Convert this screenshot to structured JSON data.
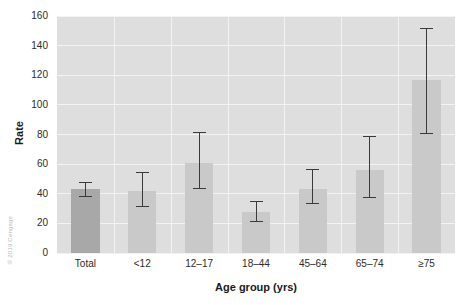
{
  "chart_data": {
    "type": "bar",
    "title": "",
    "xlabel": "Age group (yrs)",
    "ylabel": "Rate",
    "categories": [
      "Total",
      "<12",
      "12–17",
      "18–44",
      "45–64",
      "65–74",
      "≥75"
    ],
    "values": [
      43,
      42,
      61,
      28,
      43,
      56,
      117
    ],
    "errors_low": [
      38,
      31,
      43,
      21,
      33,
      37,
      80
    ],
    "errors_high": [
      48,
      55,
      82,
      35,
      57,
      79,
      152
    ],
    "ylim": [
      0,
      160
    ],
    "yticks": [
      0,
      20,
      40,
      60,
      80,
      100,
      120,
      140,
      160
    ],
    "ytick_labels": [
      "0",
      "20",
      "40",
      "60",
      "80",
      "100",
      "120",
      "140",
      "160"
    ],
    "grid": true,
    "legend": "none",
    "series": [
      {
        "name": "Rate",
        "values": [
          43,
          42,
          61,
          28,
          43,
          56,
          117
        ]
      }
    ],
    "colors": {
      "panel_background": "#dedede",
      "gridline": "#f2f2f2",
      "bar": "#c9c9c9",
      "bar_highlight": "#a8a8a8",
      "error_bar": "#3a3a3a",
      "text": "#2b2b2b"
    }
  },
  "credit": {
    "text": "© 2019 Cengage"
  }
}
